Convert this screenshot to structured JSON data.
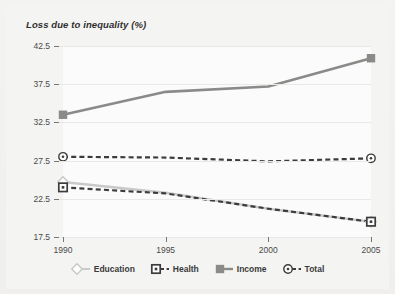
{
  "chart_data": {
    "type": "line",
    "title": "Loss due to inequality  (%)",
    "xlabel": "",
    "ylabel": "",
    "x": [
      1990,
      1995,
      2000,
      2005
    ],
    "xtick_labels": [
      "1990",
      "1995",
      "2000",
      "2005"
    ],
    "ytick_labels": [
      "42.5",
      "37.5",
      "32.5",
      "27.5",
      "22.5",
      "17.5"
    ],
    "ytick_values": [
      42.5,
      37.5,
      32.5,
      27.5,
      22.5,
      17.5
    ],
    "ylim": [
      17.5,
      42.5
    ],
    "xlim": [
      1990,
      2005
    ],
    "grid": true,
    "legend_position": "bottom",
    "series": [
      {
        "name": "Education",
        "values": [
          24.7,
          23.3,
          21.2,
          19.5
        ],
        "color": "#c9c9c7",
        "style": "solid",
        "marker": "diamond-outline"
      },
      {
        "name": "Health",
        "values": [
          24.0,
          23.2,
          21.2,
          19.5
        ],
        "color": "#3c3c3c",
        "style": "dashed",
        "marker": "square-dot"
      },
      {
        "name": "Income",
        "values": [
          33.5,
          36.5,
          37.2,
          40.9
        ],
        "color": "#8a8a88",
        "style": "solid",
        "marker": "square-filled"
      },
      {
        "name": "Total",
        "values": [
          28.0,
          27.9,
          27.4,
          27.8
        ],
        "color": "#3c3c3c",
        "style": "dashed",
        "marker": "circle-dot"
      }
    ]
  },
  "legend": {
    "items": [
      {
        "label": "Education",
        "icon": "diamond-outline-icon"
      },
      {
        "label": "Health",
        "icon": "square-dot-icon"
      },
      {
        "label": "Income",
        "icon": "square-filled-icon"
      },
      {
        "label": "Total",
        "icon": "circle-dot-icon"
      }
    ]
  },
  "colors": {
    "background": "#f2f1f0",
    "plot_background": "#fbfbfb",
    "gridline": "#e9e8e7",
    "axis": "#767574",
    "text": "#4a4a4a",
    "education": "#c9c9c7",
    "health": "#3c3c3c",
    "income": "#8a8a88",
    "total": "#3c3c3c"
  }
}
